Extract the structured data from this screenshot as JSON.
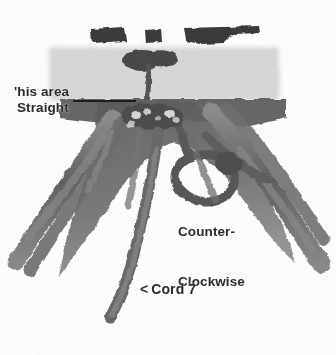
{
  "figure": {
    "background_color": "#ffffff",
    "width": 336,
    "height": 355
  },
  "annotations": {
    "this_area": {
      "text": "'his area",
      "full_text": "This area",
      "note": "left edge of word is cropped off by image border"
    },
    "straight": {
      "text": "Straight"
    },
    "counter_line1": {
      "text": "Counter-"
    },
    "counter_line2": {
      "text": "Clockwise"
    },
    "cord7": {
      "chevron": "<",
      "text": "Cord 7"
    }
  },
  "colors": {
    "background": "#ffffff",
    "cord_dark": "#5d5d5d",
    "cord_mid": "#7b7b7b",
    "cord_light": "#9a9a9a",
    "band_gray": "#d8d8d6",
    "bar_dark": "#3a3a3a",
    "text": "#2b2b2b",
    "leader_line": "#1d1d1d"
  },
  "scene": {
    "top_bars_count": 3,
    "light_band_label": "light gray horizontal band",
    "knot_cluster_label": "central knot cluster",
    "loop_label": "counter-clockwise loop",
    "hanging_cord_label": "cord 7 hanging strand"
  }
}
